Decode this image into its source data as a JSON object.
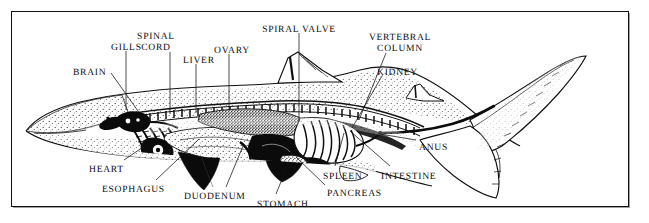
{
  "figure": {
    "kind": "anatomical-diagram",
    "style": "black-and-white line engraving with stippling",
    "border_color": "#111111",
    "background_color": "#ffffff",
    "label_color": "#0a0a0a"
  },
  "labels": [
    {
      "id": "brain",
      "text": "BRAIN",
      "x": 73,
      "y": 68,
      "align": "left",
      "lines": [
        "BRAIN"
      ]
    },
    {
      "id": "gills",
      "text": "GILLS",
      "x": 111,
      "y": 43,
      "align": "left",
      "lines": [
        "GILLS"
      ]
    },
    {
      "id": "spinal-cord",
      "text": "SPINAL CORD",
      "x": 156,
      "y": 32,
      "align": "center",
      "lines": [
        "SPINAL",
        "CORD"
      ]
    },
    {
      "id": "liver",
      "text": "LIVER",
      "x": 183,
      "y": 56,
      "align": "left",
      "lines": [
        "LIVER"
      ]
    },
    {
      "id": "ovary",
      "text": "OVARY",
      "x": 214,
      "y": 46,
      "align": "left",
      "lines": [
        "OVARY"
      ]
    },
    {
      "id": "spiral-valve",
      "text": "SPIRAL VALVE",
      "x": 299,
      "y": 25,
      "align": "center",
      "lines": [
        "SPIRAL VALVE"
      ]
    },
    {
      "id": "vertebral-column",
      "text": "VERTEBRAL COLUMN",
      "x": 400,
      "y": 33,
      "align": "center",
      "lines": [
        "VERTEBRAL",
        "COLUMN"
      ]
    },
    {
      "id": "kidney",
      "text": "KIDNEY",
      "x": 377,
      "y": 68,
      "align": "left",
      "lines": [
        "KIDNEY"
      ]
    },
    {
      "id": "anus",
      "text": "ANUS",
      "x": 419,
      "y": 143,
      "align": "left",
      "lines": [
        "ANUS"
      ]
    },
    {
      "id": "intestine",
      "text": "INTESTINE",
      "x": 381,
      "y": 172,
      "align": "left",
      "lines": [
        "INTESTINE"
      ]
    },
    {
      "id": "spleen",
      "text": "SPLEEN",
      "x": 323,
      "y": 172,
      "align": "left",
      "lines": [
        "SPLEEN"
      ]
    },
    {
      "id": "pancreas",
      "text": "PANCREAS",
      "x": 327,
      "y": 189,
      "align": "left",
      "lines": [
        "PANCREAS"
      ]
    },
    {
      "id": "stomach",
      "text": "STOMACH",
      "x": 257,
      "y": 200,
      "align": "left",
      "lines": [
        "STOMACH"
      ]
    },
    {
      "id": "duodenum",
      "text": "DUODENUM",
      "x": 184,
      "y": 192,
      "align": "left",
      "lines": [
        "DUODENUM"
      ]
    },
    {
      "id": "esophagus",
      "text": "ESOPHAGUS",
      "x": 102,
      "y": 185,
      "align": "left",
      "lines": [
        "ESOPHAGUS"
      ]
    },
    {
      "id": "heart",
      "text": "HEART",
      "x": 89,
      "y": 165,
      "align": "left",
      "lines": [
        "HEART"
      ]
    }
  ],
  "leaders": [
    {
      "id": "leader-brain",
      "from": [
        111,
        73
      ],
      "to": [
        143,
        118
      ]
    },
    {
      "id": "leader-gills",
      "from": [
        126,
        51
      ],
      "to": [
        126,
        110
      ]
    },
    {
      "id": "leader-spinal-cord",
      "from": [
        170,
        52
      ],
      "to": [
        170,
        114
      ]
    },
    {
      "id": "leader-liver",
      "from": [
        196,
        64
      ],
      "to": [
        196,
        113
      ]
    },
    {
      "id": "leader-ovary",
      "from": [
        229,
        54
      ],
      "to": [
        229,
        110
      ]
    },
    {
      "id": "leader-spiral-valve",
      "from": [
        299,
        33
      ],
      "to": [
        299,
        122
      ]
    },
    {
      "id": "leader-vertebral-column",
      "from": [
        386,
        53
      ],
      "to": [
        359,
        120
      ]
    },
    {
      "id": "leader-kidney",
      "from": [
        382,
        76
      ],
      "to": [
        352,
        128
      ]
    },
    {
      "id": "leader-anus",
      "from": [
        416,
        140
      ],
      "to": [
        380,
        134
      ]
    },
    {
      "id": "leader-intestine",
      "from": [
        390,
        166
      ],
      "to": [
        350,
        131
      ]
    },
    {
      "id": "leader-spleen",
      "from": [
        335,
        166
      ],
      "to": [
        344,
        133
      ]
    },
    {
      "id": "leader-pancreas",
      "from": [
        325,
        185
      ],
      "to": [
        296,
        157
      ]
    },
    {
      "id": "leader-stomach",
      "from": [
        276,
        194
      ],
      "to": [
        289,
        162
      ]
    },
    {
      "id": "leader-duodenum",
      "from": [
        226,
        187
      ],
      "to": [
        243,
        146
      ]
    },
    {
      "id": "leader-esophagus",
      "from": [
        156,
        180
      ],
      "to": [
        199,
        139
      ]
    },
    {
      "id": "leader-heart",
      "from": [
        124,
        160
      ],
      "to": [
        152,
        141
      ]
    }
  ],
  "anatomy_parts": [
    "brain",
    "gills",
    "spinal cord",
    "liver",
    "ovary",
    "spiral valve",
    "vertebral column",
    "kidney",
    "anus",
    "intestine",
    "spleen",
    "pancreas",
    "stomach",
    "duodenum",
    "esophagus",
    "heart"
  ]
}
